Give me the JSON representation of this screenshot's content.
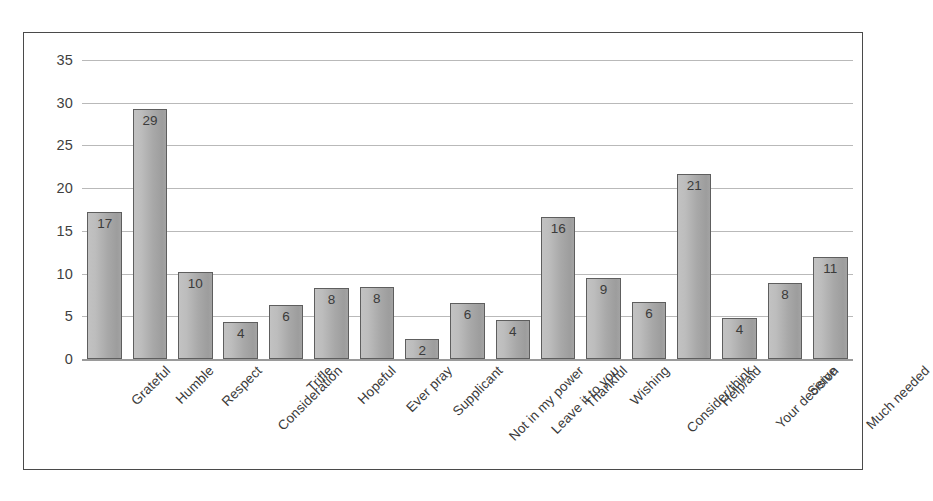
{
  "chart_data": {
    "type": "bar",
    "title": "",
    "xlabel": "",
    "ylabel": "",
    "ylim": [
      0,
      35
    ],
    "yticks": [
      0,
      5,
      10,
      15,
      20,
      25,
      30,
      35
    ],
    "grid": true,
    "legend": false,
    "orientation": "vertical",
    "data_labels": true,
    "bar_color": "#b0b0b0",
    "bar_edge_color": "#5e5e5e",
    "gridline_color": "#b9b9b9",
    "border_color": "#4a4a4a",
    "categories": [
      "Grateful",
      "Humble",
      "Respect",
      "Consideration",
      "Trifle",
      "Hopeful",
      "Ever pray",
      "Supplicant",
      "Not in my power",
      "Leave it to you",
      "Thankful",
      "Wishing",
      "Consider/think",
      "Help/aid",
      "Your decision",
      "Serve",
      "Much needed"
    ],
    "values": [
      17,
      29,
      10,
      4,
      6,
      8,
      8,
      2,
      6,
      4,
      16,
      9,
      6,
      21,
      4,
      8,
      11
    ],
    "bar_heights": [
      17.2,
      29.3,
      10.2,
      4.3,
      6.3,
      8.3,
      8.4,
      2.4,
      6.5,
      4.6,
      16.6,
      9.5,
      6.7,
      21.7,
      4.8,
      8.9,
      11.9
    ]
  }
}
